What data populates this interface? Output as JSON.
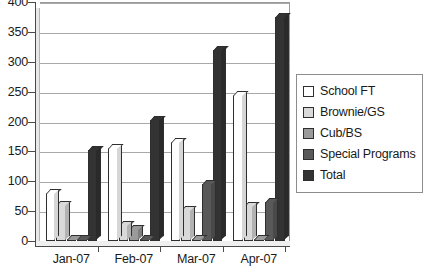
{
  "chart_data": {
    "type": "bar",
    "title": "",
    "subtitle": "",
    "xlabel": "",
    "ylabel": "",
    "categories": [
      "Jan-07",
      "Feb-07",
      "Mar-07",
      "Apr-07"
    ],
    "series": [
      {
        "name": "School FT",
        "color": "#ffffff",
        "values": [
          80,
          155,
          165,
          245
        ]
      },
      {
        "name": "Brownie/GS",
        "color": "#d9d9d9",
        "values": [
          60,
          27,
          52,
          58
        ]
      },
      {
        "name": "Cub/BS",
        "color": "#9a9a9a",
        "values": [
          2,
          20,
          4,
          0
        ]
      },
      {
        "name": "Special Programs",
        "color": "#595959",
        "values": [
          0,
          0,
          95,
          65
        ]
      },
      {
        "name": "Total",
        "color": "#333333",
        "values": [
          153,
          203,
          320,
          375
        ]
      }
    ],
    "ylim": [
      0,
      400
    ],
    "ytick_step": 50,
    "yticks": [
      "400",
      "350",
      "300",
      "250",
      "200",
      "150",
      "100",
      "50",
      "0"
    ],
    "grid": true,
    "legend_position": "right",
    "style": "3d-clustered-column"
  }
}
